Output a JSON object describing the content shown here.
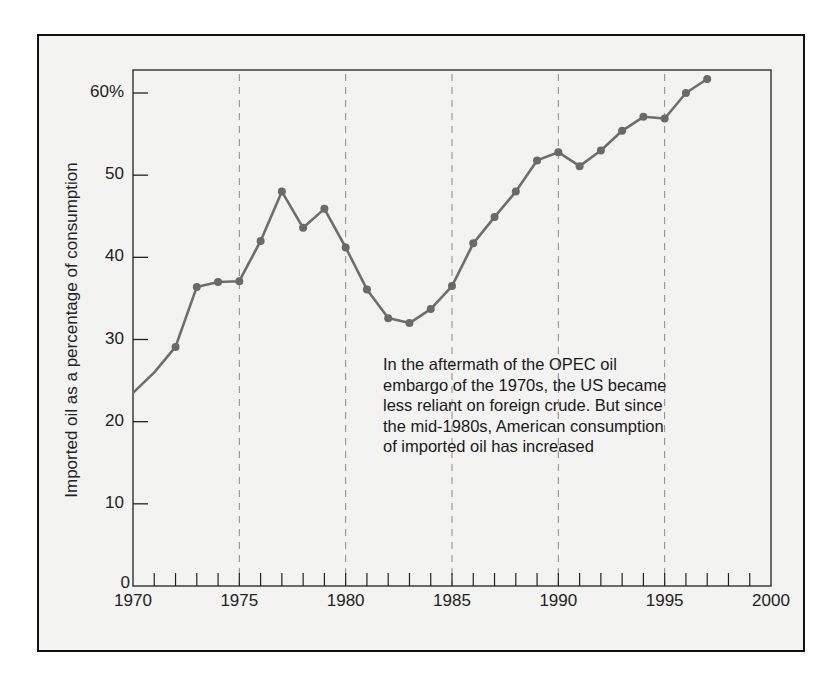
{
  "chart_data": {
    "type": "line",
    "title": "",
    "xlabel": "",
    "ylabel": "Imported oil as a percentage of consumption",
    "xlim": [
      1970,
      2000
    ],
    "ylim": [
      0,
      62
    ],
    "x_ticks": [
      "1970",
      "1975",
      "1980",
      "1985",
      "1990",
      "1995",
      "2000"
    ],
    "y_ticks": [
      "0",
      "10",
      "20",
      "30",
      "40",
      "50",
      "60%"
    ],
    "grid": "vertical dashed lines at 1975, 1980, 1985, 1990, 1995",
    "legend": null,
    "annotation": [
      "In the aftermath of the OPEC oil",
      "embargo of the 1970s, the US became",
      "less reliant on foreign crude.  But since",
      "the mid-1980s, American consumption",
      "of imported oil has increased"
    ],
    "series": [
      {
        "name": "Imported oil share",
        "x": [
          1970,
          1971,
          1972,
          1973,
          1974,
          1975,
          1976,
          1977,
          1978,
          1979,
          1980,
          1981,
          1982,
          1983,
          1984,
          1985,
          1986,
          1987,
          1988,
          1989,
          1990,
          1991,
          1992,
          1993,
          1994,
          1995,
          1996,
          1997
        ],
        "values": [
          23.5,
          26.0,
          29.1,
          36.4,
          37.0,
          37.1,
          42.0,
          48.0,
          43.6,
          45.9,
          41.2,
          36.1,
          32.6,
          32.0,
          33.7,
          36.5,
          41.7,
          44.9,
          48.0,
          51.8,
          52.8,
          51.1,
          53.0,
          55.4,
          57.1,
          56.9,
          60.0,
          61.7
        ],
        "markers_from": 1972
      }
    ]
  },
  "colors": {
    "line": "#6e6e6e",
    "marker": "#6a6a6a",
    "grid": "#8a8a8a",
    "axis": "#222222",
    "panel": "#f3f3f1"
  }
}
